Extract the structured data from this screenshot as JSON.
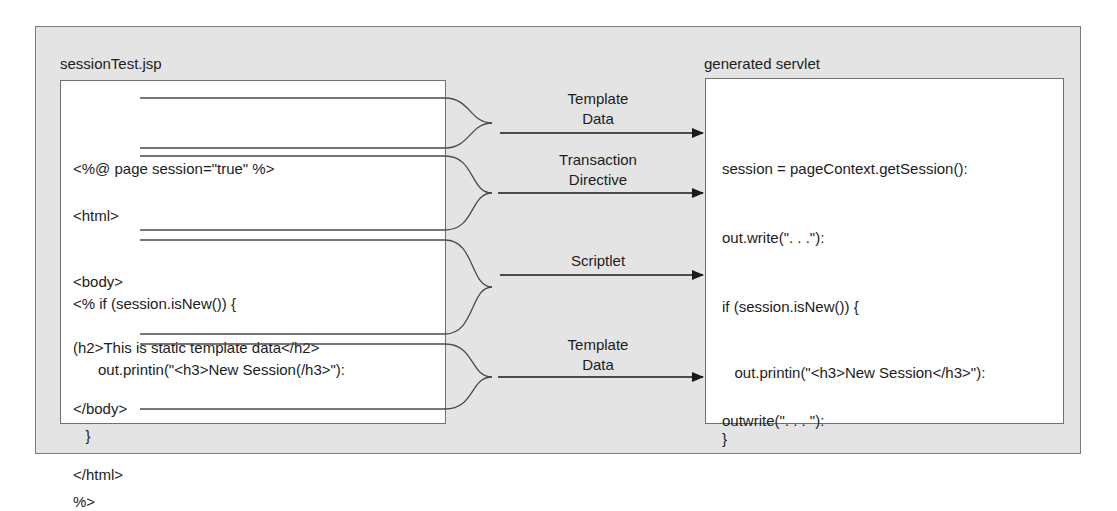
{
  "diagram": {
    "source": {
      "title": "sessionTest.jsp",
      "sections": [
        {
          "lines": [
            "<%@ page session=\"true\" %>"
          ]
        },
        {
          "lines": [
            "<html>",
            "<body>",
            "(h2>This is static template data</h2>"
          ]
        },
        {
          "lines": [
            "<% if (session.isNew()) {",
            "      out.printin(\"<h3>New Session(/h3>\"):",
            "   }",
            "%>"
          ]
        },
        {
          "lines": [
            "</body>",
            "</html>"
          ]
        }
      ]
    },
    "arrows": [
      {
        "label_line1": "Template",
        "label_line2": "Data"
      },
      {
        "label_line1": "Transaction",
        "label_line2": "Directive"
      },
      {
        "label_line1": "Scriptlet",
        "label_line2": ""
      },
      {
        "label_line1": "Template",
        "label_line2": "Data"
      }
    ],
    "target": {
      "title": "generated servlet",
      "sections": [
        {
          "lines": [
            "session = pageContext.getSession():"
          ]
        },
        {
          "lines": [
            "out.write(\". . .\"):"
          ]
        },
        {
          "lines": [
            "if (session.isNew()) {",
            "   out.printin(\"<h3>New Session</h3>\"):",
            "}"
          ]
        },
        {
          "lines": [
            "outwrite(\". . . \"):"
          ]
        }
      ]
    },
    "colors": {
      "background": "#e4e4e4",
      "box": "#ffffff",
      "line": "#4a4a4a",
      "text": "#1c1c1c"
    }
  }
}
